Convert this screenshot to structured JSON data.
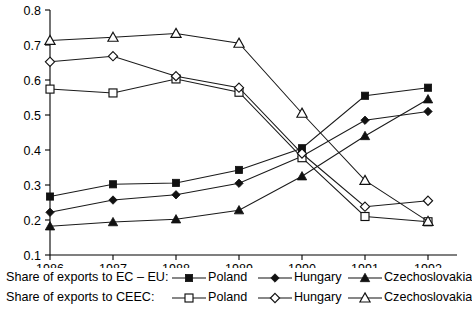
{
  "chart_data": {
    "type": "line",
    "title": "",
    "subtitle": "",
    "xlabel": "",
    "ylabel": "",
    "x": [
      1986,
      1987,
      1988,
      1989,
      1990,
      1991,
      1992
    ],
    "categories": [
      "1986",
      "1987",
      "1988",
      "1989",
      "1990",
      "1991",
      "1992"
    ],
    "xlim": [
      1986,
      1992
    ],
    "ylim": [
      0.1,
      0.8
    ],
    "yticks": [
      0.1,
      0.2,
      0.3,
      0.4,
      0.5,
      0.6,
      0.7,
      0.8
    ],
    "ytick_labels": [
      "0.1",
      "0.2",
      "0.3",
      "0.4",
      "0.5",
      "0.6",
      "0.7",
      "0.8"
    ],
    "grid": false,
    "legend_position": "below",
    "series": [
      {
        "name": "Poland",
        "group": "Share of exports to EC – EU:",
        "marker": "filled-square",
        "values": [
          0.267,
          0.302,
          0.306,
          0.343,
          0.405,
          0.555,
          0.578
        ]
      },
      {
        "name": "Hungary",
        "group": "Share of exports to EC – EU:",
        "marker": "filled-diamond",
        "values": [
          0.222,
          0.257,
          0.272,
          0.305,
          0.382,
          0.485,
          0.51
        ]
      },
      {
        "name": "Czechoslovakia",
        "group": "Share of exports to EC – EU:",
        "marker": "filled-triangle",
        "values": [
          0.182,
          0.194,
          0.202,
          0.228,
          0.325,
          0.44,
          0.545
        ]
      },
      {
        "name": "Poland",
        "group": "Share of exports to CEEC:",
        "marker": "open-square",
        "values": [
          0.574,
          0.563,
          0.603,
          0.565,
          0.378,
          0.21,
          0.195
        ]
      },
      {
        "name": "Hungary",
        "group": "Share of exports to CEEC:",
        "marker": "open-diamond",
        "values": [
          0.652,
          0.668,
          0.611,
          0.578,
          0.39,
          0.238,
          0.255
        ]
      },
      {
        "name": "Czechoslovakia",
        "group": "Share of exports to CEEC:",
        "marker": "open-triangle",
        "values": [
          0.713,
          0.722,
          0.733,
          0.705,
          0.505,
          0.313,
          0.196
        ]
      }
    ]
  },
  "legend": {
    "rows": [
      {
        "title": "Share of exports to EC – EU:",
        "entries": [
          {
            "label": "Poland",
            "marker": "filled-square"
          },
          {
            "label": "Hungary",
            "marker": "filled-diamond"
          },
          {
            "label": "Czechoslovakia",
            "marker": "filled-triangle"
          }
        ]
      },
      {
        "title": "Share of exports to CEEC:",
        "entries": [
          {
            "label": "Poland",
            "marker": "open-square"
          },
          {
            "label": "Hungary",
            "marker": "open-diamond"
          },
          {
            "label": "Czechoslovakia",
            "marker": "open-triangle"
          }
        ]
      }
    ]
  },
  "caption": {
    "text": ""
  }
}
